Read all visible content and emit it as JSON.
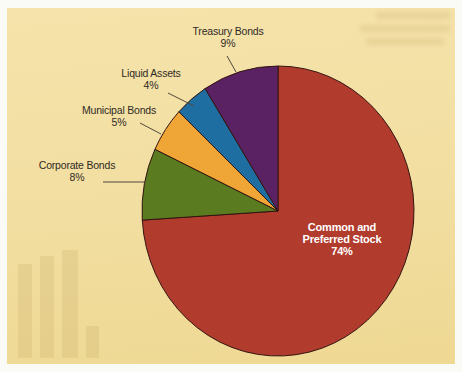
{
  "figure": {
    "page_color": "#FAFAF6",
    "panel_color": "#F2DEA0"
  },
  "chart_data": {
    "type": "pie",
    "title": "",
    "legend_position": "callout-labels",
    "direction": "clockwise",
    "start_angle_deg": 0,
    "outline_color": "#331511",
    "label_color": "#2F2A25",
    "inner_label_color": "#FFFFFF",
    "slices": [
      {
        "label": "Common and Preferred Stock",
        "value": 74,
        "value_label": "74%",
        "color": "#B13B2D"
      },
      {
        "label": "Corporate Bonds",
        "value": 8,
        "value_label": "8%",
        "color": "#5A7B20"
      },
      {
        "label": "Municipal Bonds",
        "value": 5,
        "value_label": "5%",
        "color": "#F0A637"
      },
      {
        "label": "Liquid Assets",
        "value": 4,
        "value_label": "4%",
        "color": "#1E6EA1"
      },
      {
        "label": "Treasury Bonds",
        "value": 9,
        "value_label": "9%",
        "color": "#5A2163"
      }
    ]
  }
}
